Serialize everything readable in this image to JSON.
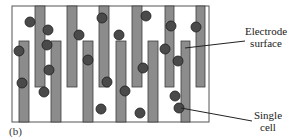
{
  "panel_label": "(b)",
  "labels": {
    "electrode_line1": "Electrode",
    "electrode_line2": "surface",
    "cell_line1": "Single",
    "cell_line2": "cell"
  },
  "colors": {
    "background": "#ffffff",
    "frame": "#555555",
    "electrode_fill": "#8c8c8c",
    "electrode_stroke": "#3c3c3c",
    "cell_fill": "#4a4a4a",
    "cell_stroke": "#1e1e1e",
    "leader_line": "#222222"
  },
  "frame": {
    "x": 12,
    "y": 6,
    "w": 197,
    "h": 116
  },
  "electrodes_top": [
    {
      "x": 35,
      "y": 6,
      "w": 10,
      "h": 81
    },
    {
      "x": 67,
      "y": 6,
      "w": 10,
      "h": 81
    },
    {
      "x": 99,
      "y": 6,
      "w": 10,
      "h": 81
    },
    {
      "x": 132,
      "y": 6,
      "w": 10,
      "h": 81
    },
    {
      "x": 165,
      "y": 6,
      "w": 9,
      "h": 81
    },
    {
      "x": 196,
      "y": 6,
      "w": 9,
      "h": 81
    }
  ],
  "electrodes_bottom": [
    {
      "x": 19,
      "y": 41,
      "w": 10,
      "h": 81
    },
    {
      "x": 51,
      "y": 41,
      "w": 10,
      "h": 81
    },
    {
      "x": 83,
      "y": 41,
      "w": 10,
      "h": 81
    },
    {
      "x": 116,
      "y": 41,
      "w": 10,
      "h": 81
    },
    {
      "x": 148,
      "y": 41,
      "w": 10,
      "h": 81
    },
    {
      "x": 181,
      "y": 41,
      "w": 9,
      "h": 81
    }
  ],
  "cells": [
    {
      "cx": 30,
      "cy": 22
    },
    {
      "cx": 48,
      "cy": 30
    },
    {
      "cx": 19,
      "cy": 51
    },
    {
      "cx": 47,
      "cy": 45
    },
    {
      "cx": 22,
      "cy": 83
    },
    {
      "cx": 49,
      "cy": 70
    },
    {
      "cx": 44,
      "cy": 92
    },
    {
      "cx": 79,
      "cy": 35
    },
    {
      "cx": 88,
      "cy": 60
    },
    {
      "cx": 102,
      "cy": 18
    },
    {
      "cx": 119,
      "cy": 35
    },
    {
      "cx": 107,
      "cy": 82
    },
    {
      "cx": 101,
      "cy": 109
    },
    {
      "cx": 125,
      "cy": 91
    },
    {
      "cx": 146,
      "cy": 16
    },
    {
      "cx": 143,
      "cy": 68
    },
    {
      "cx": 140,
      "cy": 113
    },
    {
      "cx": 171,
      "cy": 26
    },
    {
      "cx": 165,
      "cy": 49
    },
    {
      "cx": 178,
      "cy": 61
    },
    {
      "cx": 175,
      "cy": 96
    },
    {
      "cx": 179,
      "cy": 108
    },
    {
      "cx": 196,
      "cy": 27
    }
  ],
  "cell_radius": 5,
  "leaders": {
    "electrode": {
      "x1": 185,
      "y1": 48,
      "x2": 245,
      "y2": 41
    },
    "cell": {
      "x1": 181,
      "y1": 108,
      "x2": 252,
      "y2": 121
    }
  }
}
